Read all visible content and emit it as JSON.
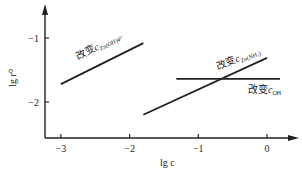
{
  "chart_data": {
    "type": "line",
    "title": "",
    "xlabel": "lg c",
    "ylabel": "lg r⁰",
    "xlim": [
      -3.2,
      0.45
    ],
    "ylim": [
      -2.55,
      -0.3
    ],
    "xticks": [
      {
        "value": -3,
        "label": "−3"
      },
      {
        "value": -2,
        "label": "−2"
      },
      {
        "value": -1,
        "label": "−1"
      },
      {
        "value": 0,
        "label": "0"
      }
    ],
    "yticks": [
      {
        "value": -1,
        "label": "−1"
      },
      {
        "value": -2,
        "label": "−2"
      }
    ],
    "grid": false,
    "series": [
      {
        "name": "改变c_Zn(OH)4²⁻",
        "label_main": "改变",
        "label_var": "c",
        "label_sub": "Zn(OH)4²⁻",
        "x": [
          -3.0,
          -1.8
        ],
        "y": [
          -1.72,
          -1.08
        ]
      },
      {
        "name": "改变c_Zn(NH3)",
        "label_main": "改变",
        "label_var": "c",
        "label_sub": "Zn(NH₃)",
        "x": [
          -1.8,
          0.0
        ],
        "y": [
          -2.2,
          -1.31
        ]
      },
      {
        "name": "改变c_OH",
        "label_main": "改变",
        "label_var": "c",
        "label_sub": "OH",
        "x": [
          -1.32,
          0.19
        ],
        "y": [
          -1.64,
          -1.64
        ]
      }
    ]
  }
}
